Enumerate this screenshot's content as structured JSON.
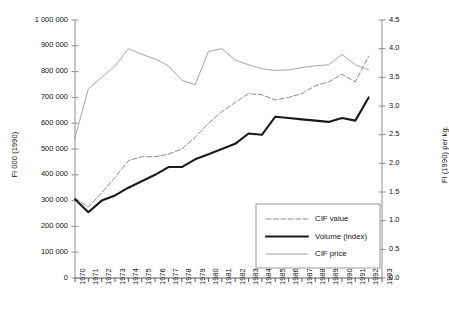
{
  "chart_data": {
    "type": "line",
    "title": "",
    "xlabel": "",
    "ylabel": "Fl 000 (1990)",
    "ylabel_right": "Fl (1990) per kg.",
    "grid": false,
    "legend_position": "bottom-right",
    "x": [
      1970,
      1971,
      1972,
      1973,
      1974,
      1975,
      1976,
      1977,
      1978,
      1979,
      1980,
      1981,
      1982,
      1983,
      1984,
      1985,
      1986,
      1987,
      1988,
      1989,
      1990,
      1991,
      1992
    ],
    "xlim": [
      1970,
      1993
    ],
    "xticks": [
      "1970",
      "1971",
      "1972",
      "1973",
      "1974",
      "1975",
      "1976",
      "1977",
      "1978",
      "1979",
      "1980",
      "1981",
      "1982",
      "1983",
      "1984",
      "1985",
      "1986",
      "1987",
      "1988",
      "1989",
      "1990",
      "1991",
      "1992",
      "1993"
    ],
    "ylim": [
      0,
      1000000
    ],
    "yticks": [
      "0",
      "100 000",
      "200 000",
      "300 000",
      "400 000",
      "500 000",
      "600 000",
      "700 000",
      "800 000",
      "900 000",
      "1 000 000"
    ],
    "ylim_right": [
      0.0,
      4.5
    ],
    "yticks_right": [
      "0.0",
      "0.5",
      "1.0",
      "1.5",
      "2.0",
      "2.5",
      "3.0",
      "3.5",
      "4.0",
      "4.5"
    ],
    "series": [
      {
        "name": "CIF value",
        "axis": "left",
        "style": "dashed",
        "color": "#8a8a8a",
        "values": [
          310000,
          275000,
          330000,
          390000,
          455000,
          470000,
          470000,
          480000,
          500000,
          545000,
          600000,
          645000,
          680000,
          715000,
          710000,
          690000,
          700000,
          715000,
          745000,
          760000,
          790000,
          760000,
          860000
        ]
      },
      {
        "name": "Volume (index)",
        "axis": "left",
        "style": "solid-thick",
        "color": "#1a1a1a",
        "values": [
          305000,
          255000,
          300000,
          320000,
          350000,
          375000,
          400000,
          430000,
          430000,
          460000,
          480000,
          500000,
          520000,
          560000,
          555000,
          625000,
          620000,
          615000,
          610000,
          605000,
          620000,
          610000,
          700000
        ]
      },
      {
        "name": "CIF price",
        "axis": "right",
        "style": "solid-thin",
        "color": "#9a9a9a",
        "values": [
          2.45,
          3.3,
          3.5,
          3.7,
          4.0,
          3.9,
          3.82,
          3.7,
          3.45,
          3.37,
          3.95,
          4.0,
          3.8,
          3.72,
          3.65,
          3.62,
          3.63,
          3.67,
          3.7,
          3.72,
          3.9,
          3.72,
          3.63
        ]
      }
    ],
    "legend": [
      {
        "label": "CIF value",
        "style": "dashed",
        "color": "#8a8a8a"
      },
      {
        "label": "Volume (index)",
        "style": "solid-thick",
        "color": "#1a1a1a"
      },
      {
        "label": "CIF price",
        "style": "solid-thin",
        "color": "#9a9a9a"
      }
    ]
  },
  "axes": {
    "left_title": "Fl 000 (1990)",
    "right_title": "Fl (1990) per kg."
  }
}
